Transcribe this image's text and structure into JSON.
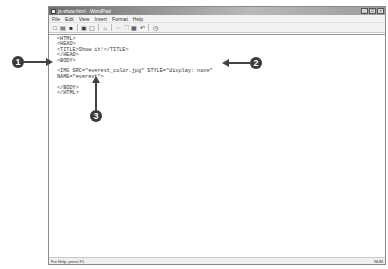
{
  "window": {
    "title": "js-show.html - WordPad",
    "controls": [
      "minimize",
      "maximize",
      "close"
    ]
  },
  "menubar": {
    "items": [
      "File",
      "Edit",
      "View",
      "Insert",
      "Format",
      "Help"
    ]
  },
  "toolbar": {
    "buttons": [
      {
        "name": "new-icon",
        "glyph": "□"
      },
      {
        "name": "open-icon",
        "glyph": "▤"
      },
      {
        "name": "save-icon",
        "glyph": "■"
      },
      {
        "name": "print-icon",
        "glyph": "▣"
      },
      {
        "name": "print-preview-icon",
        "glyph": "▢"
      },
      {
        "name": "find-icon",
        "glyph": "⌂"
      },
      {
        "name": "cut-icon",
        "glyph": "✂"
      },
      {
        "name": "copy-icon",
        "glyph": "❐"
      },
      {
        "name": "paste-icon",
        "glyph": "▦"
      },
      {
        "name": "undo-icon",
        "glyph": "↶"
      },
      {
        "name": "insert-datetime-icon",
        "glyph": "◷"
      }
    ]
  },
  "document": {
    "lines": [
      "<HTML>",
      "<HEAD>",
      "<TITLE>Show it!</TITLE>",
      "</HEAD>",
      "<BODY>",
      "",
      "<IMG SRC=\"everest_color.jpg\" STYLE=\"display: none\"",
      "NAME=\"everest\">",
      "",
      "</BODY>",
      "</HTML>"
    ]
  },
  "statusbar": {
    "left": "For Help, press F1",
    "right": "NUM"
  },
  "callouts": [
    {
      "label": "1"
    },
    {
      "label": "2"
    },
    {
      "label": "3"
    }
  ]
}
